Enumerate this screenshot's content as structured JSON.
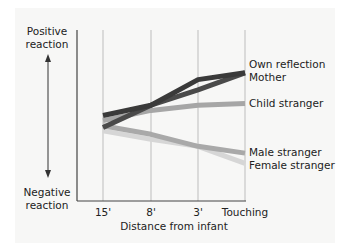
{
  "chart_data": {
    "type": "line",
    "title": "",
    "xlabel": "Distance from infant",
    "ylabel_top": [
      "Positive",
      "reaction"
    ],
    "ylabel_bottom": [
      "Negative",
      "reaction"
    ],
    "categories": [
      "15'",
      "8'",
      "3'",
      "Touching"
    ],
    "ylim": [
      0,
      10
    ],
    "y_units": "relative reaction (estimated, unlabeled scale)",
    "grid": "vertical lines at each category",
    "legend_position": "direct labels at right end of lines",
    "series": [
      {
        "name": "Own reflection",
        "color": "#3a3a3a",
        "values": [
          5.0,
          5.6,
          7.1,
          7.5
        ]
      },
      {
        "name": "Mother",
        "color": "#4a4a4a",
        "values": [
          4.3,
          5.6,
          6.5,
          7.5
        ]
      },
      {
        "name": "Child stranger",
        "color": "#a6a6a6",
        "values": [
          4.7,
          5.3,
          5.6,
          5.7
        ]
      },
      {
        "name": "Male stranger",
        "color": "#a9a9a9",
        "values": [
          4.4,
          3.9,
          3.2,
          2.8
        ]
      },
      {
        "name": "Female stranger",
        "color": "#d6d6d6",
        "values": [
          4.1,
          3.6,
          3.2,
          2.2
        ]
      }
    ]
  }
}
